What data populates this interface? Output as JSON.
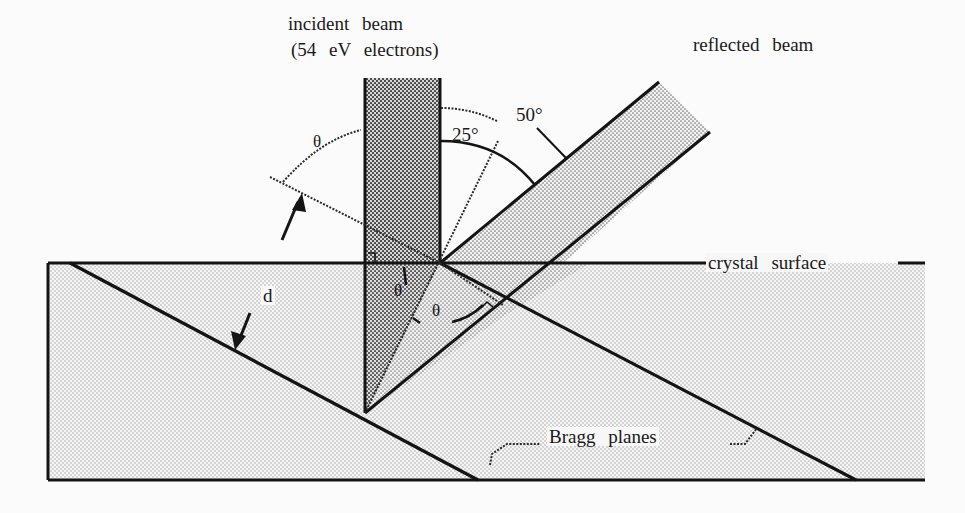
{
  "diagram": {
    "labels": {
      "incident_line1": "incident beam",
      "incident_line2": "(54 eV electrons)",
      "reflected": "reflected beam",
      "crystal_surface": "crystal surface",
      "bragg_planes": "Bragg planes",
      "spacing": "d",
      "angle_50": "50°",
      "angle_25": "25°",
      "theta_top": "θ",
      "theta_inner_left": "θ",
      "theta_inner_right": "θ"
    },
    "colors": {
      "line": "#141414",
      "fill_dot": "#6a6a6a",
      "background": "#fbfbfb"
    },
    "values": {
      "electron_energy_eV": 54,
      "scattering_angle_deg": 50,
      "half_angle_deg": 25
    }
  }
}
